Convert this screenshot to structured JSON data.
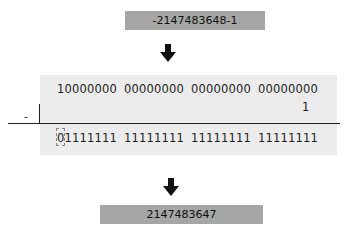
{
  "top_box": {
    "label": "-2147483648-1"
  },
  "arrows": [
    {
      "name": "down-arrow-1"
    },
    {
      "name": "down-arrow-2"
    }
  ],
  "subtraction": {
    "operator": "-",
    "minuend": [
      "10000000",
      "00000000",
      "00000000",
      "00000000"
    ],
    "subtrahend": "1",
    "result": [
      "01111111",
      "11111111",
      "11111111",
      "11111111"
    ],
    "highlighted_bit": "0"
  },
  "bottom_box": {
    "label": "2147483647"
  },
  "colors": {
    "box_bg": "#a6a6a6",
    "panel_bg": "#ececec",
    "line": "#222222"
  }
}
